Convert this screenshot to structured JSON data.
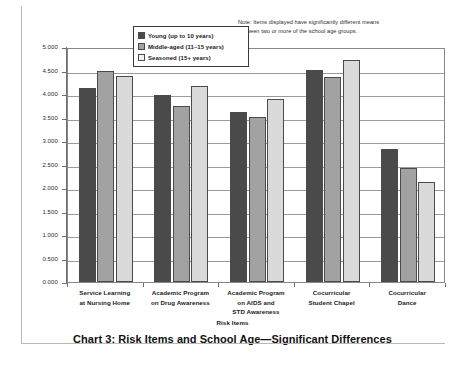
{
  "chart_data": {
    "type": "bar",
    "title": "Chart 3: Risk Items and School Age—Significant Differences",
    "xlabel": "Risk Items",
    "ylabel": "Risk Item Means",
    "ylim": [
      0,
      5
    ],
    "ytick_step": 0.5,
    "ytick_labels": [
      "0.000",
      "0.500",
      "1.000",
      "1.500",
      "2.000",
      "2.500",
      "3.000",
      "3.500",
      "4.000",
      "4.500",
      "5.000"
    ],
    "ytick_values": [
      0,
      0.5,
      1,
      1.5,
      2,
      2.5,
      3,
      3.5,
      4,
      4.5,
      5
    ],
    "grid": true,
    "legend_position": "top-center-inside",
    "categories": [
      "Service Learning\nat Nursing Home",
      "Academic Program\non Drug Awareness",
      "Academic Program\non AIDS and\nSTD Awareness",
      "Cocurricular\nStudent Chapel",
      "Cocurricular\nDance"
    ],
    "category_lines": [
      [
        "Service Learning",
        "at Nursing Home"
      ],
      [
        "Academic Program",
        "on Drug Awareness"
      ],
      [
        "Academic Program",
        "on AIDS and",
        "STD Awareness"
      ],
      [
        "Cocurricular",
        "Student Chapel"
      ],
      [
        "Cocurricular",
        "Dance"
      ]
    ],
    "series": [
      {
        "name": "Young (up to 10 years)",
        "color": "#4a4a4a",
        "values": [
          4.13,
          3.98,
          3.61,
          4.51,
          2.84
        ]
      },
      {
        "name": "Middle-aged (11–15 years)",
        "color": "#a2a2a2",
        "values": [
          4.49,
          3.75,
          3.51,
          4.37,
          2.43
        ]
      },
      {
        "name": "Seasoned (15+ years)",
        "color": "#dadada",
        "values": [
          4.39,
          4.16,
          3.9,
          4.73,
          2.12
        ]
      }
    ],
    "annotations": [
      "Note: Items displayed have significantly different means between two or more of the school age groups."
    ]
  },
  "note": {
    "line1": "Note: Items displayed have significantly different means",
    "line2": "between two or more of the school age groups."
  },
  "legend": {
    "items": [
      {
        "label": "Young (up to 10 years)",
        "swatch": "dark-gray-swatch"
      },
      {
        "label": "Middle-aged (11–15 years)",
        "swatch": "medium-gray-swatch"
      },
      {
        "label": "Seasoned (15+ years)",
        "swatch": "light-gray-swatch"
      }
    ]
  },
  "axes": {
    "y_title": "Risk Item Means",
    "x_title": "Risk Items"
  },
  "title": "Chart 3: Risk Items and School Age—Significant Differences"
}
